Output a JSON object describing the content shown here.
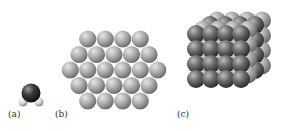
{
  "figure": {
    "panels": [
      {
        "id": "a",
        "label": "(a)",
        "description": "single molecule (water-like)"
      },
      {
        "id": "b",
        "label": "(b)",
        "description": "hexagonal close-packed layer",
        "rows": [
          4,
          5,
          6,
          5,
          4
        ]
      },
      {
        "id": "c",
        "label": "(c)",
        "description": "3D cubic crystal lattice of spheres"
      }
    ]
  },
  "colors": {
    "molecule_dark": "#2a2a2a",
    "molecule_light": "#d8d8d8",
    "layer_sphere": "#a8a8a8",
    "lattice_dark": "#555555",
    "lattice_light": "#b0b0b0"
  }
}
